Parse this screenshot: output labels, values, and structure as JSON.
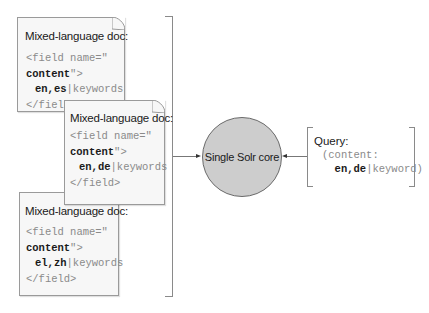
{
  "documents": [
    {
      "title": "Mixed-language doc:",
      "code_line1": "<field name=\"",
      "code_line2_bold": "content",
      "code_line2_rest": "\">",
      "langs": "en,es",
      "sep": "|",
      "keywords": "keywords",
      "code_close": "</field>"
    },
    {
      "title": "Mixed-language doc:",
      "code_line1": "<field name=\"",
      "code_line2_bold": "content",
      "code_line2_rest": "\">",
      "langs": "en,de",
      "sep": "|",
      "keywords": "keywords",
      "code_close": "</field>"
    },
    {
      "title": "Mixed-language doc:",
      "code_line1": "<field name=\"",
      "code_line2_bold": "content",
      "code_line2_rest": "\">",
      "langs": "el,zh",
      "sep": "|",
      "keywords": "keywords",
      "code_close": "</field>"
    }
  ],
  "core": {
    "label": "Single Solr core",
    "fill": "#cdcdcd"
  },
  "query": {
    "title": "Query:",
    "line1": "(content:",
    "langs": "en,de",
    "sep": "|",
    "keyword": "keyword)"
  }
}
